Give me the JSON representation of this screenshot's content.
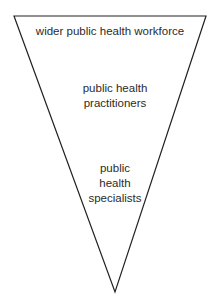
{
  "diagram": {
    "shape": "inverted-triangle",
    "stroke_color": "#222222",
    "levels": [
      {
        "lines": [
          "wider public health workforce"
        ]
      },
      {
        "lines": [
          "public health",
          "practitioners"
        ]
      },
      {
        "lines": [
          "public",
          "health",
          "specialists"
        ]
      }
    ]
  }
}
